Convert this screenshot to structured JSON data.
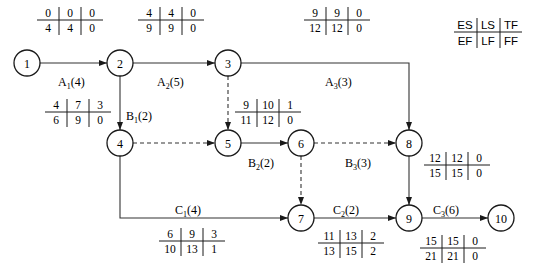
{
  "legend": {
    "ES": "ES",
    "LS": "LS",
    "TF": "TF",
    "EF": "EF",
    "LF": "LF",
    "FF": "FF"
  },
  "nodes": [
    {
      "id": "1",
      "x": 27,
      "y": 63
    },
    {
      "id": "2",
      "x": 120,
      "y": 63
    },
    {
      "id": "3",
      "x": 228,
      "y": 63
    },
    {
      "id": "4",
      "x": 120,
      "y": 143
    },
    {
      "id": "5",
      "x": 228,
      "y": 143
    },
    {
      "id": "6",
      "x": 301,
      "y": 143
    },
    {
      "id": "7",
      "x": 301,
      "y": 218
    },
    {
      "id": "8",
      "x": 409,
      "y": 143
    },
    {
      "id": "9",
      "x": 409,
      "y": 218
    },
    {
      "id": "10",
      "x": 501,
      "y": 218
    }
  ],
  "activities": [
    {
      "name": "A1",
      "main": "A",
      "sub": "1",
      "duration": "(4)",
      "from": "1",
      "to": "2",
      "ES": "0",
      "LS": "0",
      "TF": "0",
      "EF": "4",
      "LF": "4",
      "FF": "0"
    },
    {
      "name": "A2",
      "main": "A",
      "sub": "2",
      "duration": "(5)",
      "from": "2",
      "to": "3",
      "ES": "4",
      "LS": "4",
      "TF": "0",
      "EF": "9",
      "LF": "9",
      "FF": "0"
    },
    {
      "name": "A3",
      "main": "A",
      "sub": "3",
      "duration": "(3)",
      "from": "3",
      "to": "8",
      "ES": "9",
      "LS": "9",
      "TF": "0",
      "EF": "12",
      "LF": "12",
      "FF": "0"
    },
    {
      "name": "B1",
      "main": "B",
      "sub": "1",
      "duration": "(2)",
      "from": "2",
      "to": "4",
      "ES": "4",
      "LS": "7",
      "TF": "3",
      "EF": "6",
      "LF": "9",
      "FF": "0"
    },
    {
      "name": "B2",
      "main": "B",
      "sub": "2",
      "duration": "(2)",
      "from": "5",
      "to": "6",
      "ES": "9",
      "LS": "10",
      "TF": "1",
      "EF": "11",
      "LF": "12",
      "FF": "0"
    },
    {
      "name": "B3",
      "main": "B",
      "sub": "3",
      "duration": "(3)",
      "from": "8",
      "to": "9",
      "ES": "12",
      "LS": "12",
      "TF": "0",
      "EF": "15",
      "LF": "15",
      "FF": "0"
    },
    {
      "name": "C1",
      "main": "C",
      "sub": "1",
      "duration": "(4)",
      "from": "4",
      "to": "7",
      "ES": "6",
      "LS": "9",
      "TF": "3",
      "EF": "10",
      "LF": "13",
      "FF": "1"
    },
    {
      "name": "C2",
      "main": "C",
      "sub": "2",
      "duration": "(2)",
      "from": "7",
      "to": "9",
      "ES": "11",
      "LS": "13",
      "TF": "2",
      "EF": "13",
      "LF": "15",
      "FF": "2"
    },
    {
      "name": "C3",
      "main": "C",
      "sub": "3",
      "duration": "(6)",
      "from": "9",
      "to": "10",
      "ES": "15",
      "LS": "15",
      "TF": "0",
      "EF": "21",
      "LF": "21",
      "FF": "0"
    }
  ],
  "dummies": [
    {
      "from": "3",
      "to": "5"
    },
    {
      "from": "4",
      "to": "5"
    },
    {
      "from": "6",
      "to": "7"
    },
    {
      "from": "6",
      "to": "8"
    }
  ]
}
